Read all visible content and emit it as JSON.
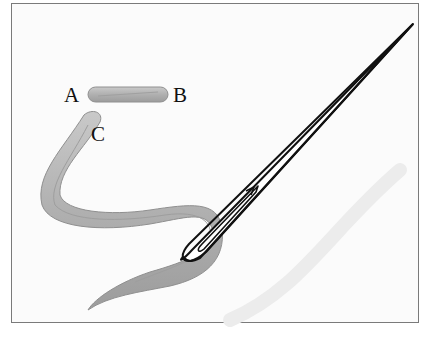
{
  "figure": {
    "labels": [
      {
        "id": "A",
        "text": "A"
      },
      {
        "id": "B",
        "text": "B"
      },
      {
        "id": "C",
        "text": "C"
      }
    ],
    "colors": {
      "frame": "#7a7a7a",
      "thread": "#b5b5b5",
      "thread_shadow": "#8f8f8f",
      "needle": "#111111",
      "background": "#fbfbfb"
    }
  }
}
